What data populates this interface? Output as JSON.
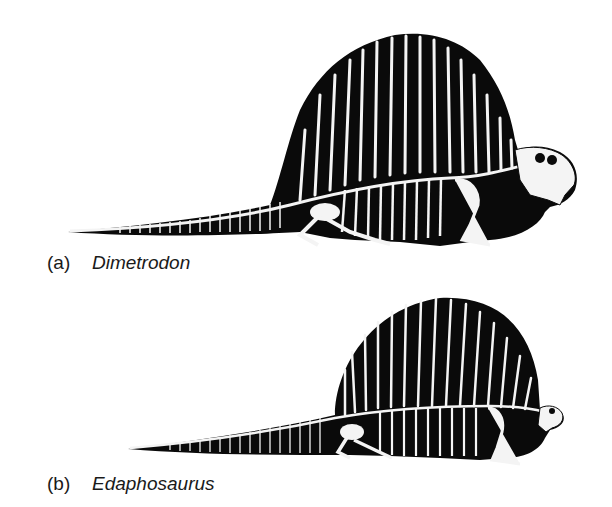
{
  "figures": [
    {
      "id": "a",
      "letter": "(a)",
      "name": "Dimetrodon",
      "description": "Skeletal silhouette of Dimetrodon with tall dorsal sail supported by elongated neural spines, long tapering tail, large skull with teeth facing right"
    },
    {
      "id": "b",
      "letter": "(b)",
      "name": "Edaphosaurus",
      "description": "Skeletal silhouette of Edaphosaurus with rounded fan-shaped dorsal sail, long tapering tail, small skull facing right"
    }
  ],
  "colors": {
    "silhouette": "#0a0a0a",
    "bone": "#f4f4f4",
    "background": "#ffffff"
  }
}
